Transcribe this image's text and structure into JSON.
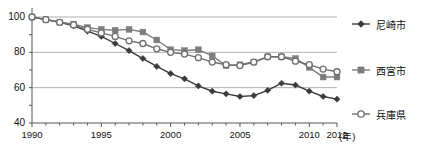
{
  "chart_data": {
    "type": "line",
    "title": "",
    "xlabel": "(年)",
    "ylabel": "",
    "xlim": [
      1990,
      2012
    ],
    "ylim": [
      40,
      100
    ],
    "grid": true,
    "legend_position": "right",
    "y_ticks": [
      40,
      60,
      80,
      100
    ],
    "y_minor_ticks": [
      50,
      70,
      90
    ],
    "x_ticks": [
      1990,
      1995,
      2000,
      2005,
      2010,
      2012
    ],
    "x": [
      1990,
      1991,
      1992,
      1993,
      1994,
      1995,
      1996,
      1997,
      1998,
      1999,
      2000,
      2001,
      2002,
      2003,
      2004,
      2005,
      2006,
      2007,
      2008,
      2009,
      2010,
      2011,
      2012
    ],
    "series": [
      {
        "name": "尼崎市",
        "marker": "diamond",
        "color": "#3a3a3a",
        "values": [
          100,
          98.5,
          97,
          95,
          92,
          89,
          85,
          81,
          76.5,
          72,
          68,
          65,
          61,
          58,
          56.5,
          55,
          55.5,
          58.5,
          62.5,
          61.5,
          58,
          55,
          53.5
        ]
      },
      {
        "name": "西宮市",
        "marker": "square",
        "color": "#7d7d7d",
        "values": [
          100,
          98.5,
          97,
          96,
          94,
          93,
          92.5,
          93,
          91.5,
          87,
          81.5,
          81,
          81.5,
          78,
          72.5,
          73,
          74.5,
          77.5,
          77.5,
          76.5,
          71.5,
          66,
          66
        ]
      },
      {
        "name": "兵庫県",
        "marker": "circle-open",
        "color": "#6e6e6e",
        "values": [
          100,
          98.5,
          97,
          95.5,
          93,
          91,
          89,
          86.5,
          85,
          82,
          80,
          79,
          77,
          74.5,
          73,
          72.5,
          74.5,
          77.5,
          77.5,
          75,
          73,
          70.5,
          69
        ]
      }
    ]
  },
  "legend": {
    "items": [
      {
        "label": "尼崎市"
      },
      {
        "label": "西宮市"
      },
      {
        "label": "兵庫県"
      }
    ]
  },
  "axis": {
    "y_tick_labels": [
      "100",
      "80",
      "60",
      "40"
    ],
    "x_tick_labels": [
      "1990",
      "1995",
      "2000",
      "2005",
      "2010",
      "2012"
    ],
    "x_unit_label": "(年)"
  }
}
